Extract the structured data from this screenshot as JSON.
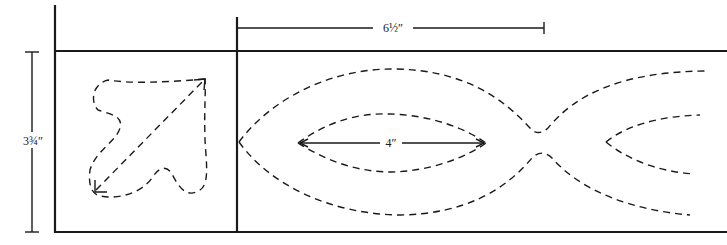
{
  "diagram": {
    "type": "border pattern template",
    "dimensions": {
      "width_label": "6½″",
      "height_label": "3¾″",
      "inner_length_label": "4″"
    },
    "elements": [
      {
        "name": "corner-tile",
        "content": "dashed arrow / leaf motif"
      },
      {
        "name": "border-strip",
        "content": "dashed interlocking fish-like ellipse chain"
      }
    ],
    "colors": {
      "line": "#1a1a1a",
      "background": "#ffffff"
    }
  }
}
